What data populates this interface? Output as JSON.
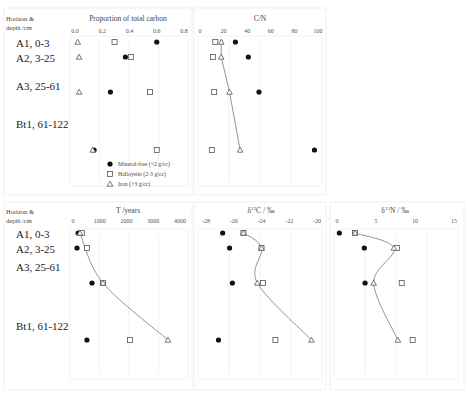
{
  "row_header": {
    "line1": "Horizon &",
    "line2": "depth /cm"
  },
  "horizons": [
    "A1, 0-3",
    "A2, 3-25",
    "A3, 25-61",
    "Bt1, 61-122"
  ],
  "legend": [
    {
      "marker": "circle",
      "label": "Mineral-free (<2 g/cc)"
    },
    {
      "marker": "square",
      "label": "Halloysite (2-3 g/cc)"
    },
    {
      "marker": "triangle",
      "label": "Iron (>3 g/cc)"
    }
  ],
  "colors": {
    "circle_fill": "#111111",
    "open_marker_stroke": "#555555",
    "trend_line": "#888888"
  },
  "chart_data": [
    {
      "type": "scatter",
      "title": "Proportion of total carbon",
      "xlabel": "Proportion of total carbon",
      "ylabel": "Horizon & depth /cm",
      "xlim": [
        0.0,
        0.8
      ],
      "xticks": [
        "0.0",
        "0.2",
        "0.4",
        "0.6",
        "0.8"
      ],
      "categories": [
        "A1, 0-3",
        "A2, 3-25",
        "A3, 25-61",
        "Bt1, 61-122"
      ],
      "series": [
        {
          "name": "Mineral-free (<2 g/cc)",
          "marker": "circle",
          "values": [
            0.6,
            0.37,
            0.26,
            0.14
          ]
        },
        {
          "name": "Halloysite (2-3 g/cc)",
          "marker": "square",
          "values": [
            0.29,
            0.41,
            0.55,
            0.6
          ]
        },
        {
          "name": "Iron (>3 g/cc)",
          "marker": "triangle",
          "values": [
            0.02,
            0.03,
            0.03,
            0.13
          ]
        }
      ],
      "trend_line": null,
      "legend_position": "lower right"
    },
    {
      "type": "scatter",
      "title": "C/N",
      "xlabel": "C/N",
      "xlim": [
        0,
        100
      ],
      "xticks": [
        "0",
        "20",
        "40",
        "60",
        "80",
        "100"
      ],
      "categories": [
        "A1, 0-3",
        "A2, 3-25",
        "A3, 25-61",
        "Bt1, 61-122"
      ],
      "series": [
        {
          "name": "Mineral-free (<2 g/cc)",
          "marker": "circle",
          "values": [
            30,
            41,
            50,
            97
          ]
        },
        {
          "name": "Halloysite (2-3 g/cc)",
          "marker": "square",
          "values": [
            13,
            11,
            12,
            10
          ]
        },
        {
          "name": "Iron (>3 g/cc)",
          "marker": "triangle",
          "values": [
            18,
            18,
            25,
            34
          ]
        }
      ],
      "trend_line": "Iron (>3 g/cc)"
    },
    {
      "type": "scatter",
      "title": "T /years",
      "xlabel": "T /years",
      "ylabel": "Horizon & depth /cm",
      "xlim": [
        0,
        4000
      ],
      "xticks": [
        "0",
        "1000",
        "2000",
        "3000",
        "4000"
      ],
      "categories": [
        "A1, 0-3",
        "A2, 3-25",
        "A3, 25-61",
        "Bt1, 61-122"
      ],
      "series": [
        {
          "name": "Mineral-free (<2 g/cc)",
          "marker": "circle",
          "values": [
            190,
            150,
            710,
            520
          ]
        },
        {
          "name": "Halloysite (2-3 g/cc)",
          "marker": "square",
          "values": [
            330,
            520,
            1120,
            2130
          ]
        },
        {
          "name": "Iron (>3 g/cc)",
          "marker": "triangle",
          "values": [
            260,
            null,
            1120,
            3550
          ]
        }
      ],
      "trend_line": "Iron (>3 g/cc)"
    },
    {
      "type": "scatter",
      "title": "δ13C / ‰",
      "xlabel": "δ13C / ‰",
      "xlim": [
        -28,
        -20
      ],
      "xticks": [
        "-28",
        "-26",
        "-24",
        "-22",
        "-20"
      ],
      "categories": [
        "A1, 0-3",
        "A2, 3-25",
        "A3, 25-61",
        "Bt1, 61-122"
      ],
      "series": [
        {
          "name": "Mineral-free (<2 g/cc)",
          "marker": "circle",
          "values": [
            -26.8,
            -26.3,
            -26.1,
            -27.1
          ]
        },
        {
          "name": "Halloysite (2-3 g/cc)",
          "marker": "square",
          "values": [
            -25.3,
            -24.0,
            -23.9,
            -23.0
          ]
        },
        {
          "name": "Iron (>3 g/cc)",
          "marker": "triangle",
          "values": [
            -25.3,
            -24.0,
            -24.3,
            -20.4
          ]
        }
      ],
      "trend_line": "Iron (>3 g/cc)"
    },
    {
      "type": "scatter",
      "title": "δ15N / ‰",
      "xlabel": "δ15N / ‰",
      "xlim": [
        0,
        15
      ],
      "xticks": [
        "0",
        "5",
        "10",
        "15"
      ],
      "categories": [
        "A1, 0-3",
        "A2, 3-25",
        "A3, 25-61",
        "Bt1, 61-122"
      ],
      "series": [
        {
          "name": "Mineral-free (<2 g/cc)",
          "marker": "circle",
          "values": [
            0.3,
            3.5,
            3.6,
            null
          ]
        },
        {
          "name": "Halloysite (2-3 g/cc)",
          "marker": "square",
          "values": [
            2.3,
            7.7,
            8.3,
            9.7
          ]
        },
        {
          "name": "Iron (>3 g/cc)",
          "marker": "triangle",
          "values": [
            2.3,
            7.3,
            4.7,
            7.8
          ]
        }
      ],
      "trend_line": "Iron (>3 g/cc)"
    }
  ],
  "layout": {
    "panels": [
      {
        "frame": [
          4,
          8,
          188,
          187
        ],
        "plot": [
          70,
          36,
          118,
          150
        ],
        "px0": 75,
        "px1": 184,
        "title_xy": [
          128,
          21
        ],
        "tick_y": 33,
        "rows_y": [
          42,
          57,
          92,
          150
        ],
        "legend_xy": [
          110,
          164
        ]
      },
      {
        "frame": [
          194,
          8,
          132,
          187
        ],
        "plot": [
          198,
          36,
          124,
          150
        ],
        "px0": 200,
        "px1": 318,
        "title_xy": [
          260,
          21
        ],
        "tick_y": 33,
        "rows_y": [
          42,
          57,
          92,
          150
        ]
      },
      {
        "frame": [
          4,
          202,
          188,
          188
        ],
        "plot": [
          70,
          229,
          118,
          150
        ],
        "px0": 73,
        "px1": 180,
        "title_xy": [
          128,
          213
        ],
        "tick_y": 223,
        "rows_y": [
          233,
          248,
          283,
          340
        ]
      },
      {
        "frame": [
          194,
          202,
          132,
          188
        ],
        "plot": [
          198,
          229,
          124,
          150
        ],
        "px0": 206,
        "px1": 317,
        "title_xy": [
          261,
          213
        ],
        "tick_y": 223,
        "rows_y": [
          233,
          248,
          283,
          340
        ]
      },
      {
        "frame": [
          330,
          202,
          134,
          188
        ],
        "plot": [
          334,
          229,
          124,
          150
        ],
        "px0": 337,
        "px1": 454,
        "title_xy": [
          395,
          213
        ],
        "tick_y": 223,
        "rows_y": [
          233,
          248,
          283,
          340
        ]
      }
    ],
    "row_labels_top_y": [
      47,
      62,
      90,
      128
    ],
    "row_labels_bottom_y": [
      238,
      253,
      271,
      330
    ]
  }
}
